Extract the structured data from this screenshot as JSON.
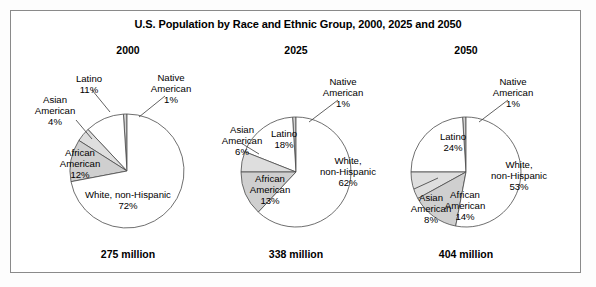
{
  "chart_data": {
    "type": "pie",
    "title": "U.S. Population by Race and Ethnic Group, 2000, 2025 and 2050",
    "legend": "none",
    "units": "percent of total population",
    "categories": [
      "Native American",
      "Latino",
      "Asian American",
      "African American",
      "White, non-Hispanic"
    ],
    "panels": [
      {
        "year": "2000",
        "total": "275 million",
        "slices": [
          {
            "label": "Native American",
            "value": 1,
            "value_text": "1%",
            "fill": "#d2d2d2"
          },
          {
            "label": "Latino",
            "value": 11,
            "value_text": "11%",
            "fill": "#ffffff"
          },
          {
            "label": "Asian American",
            "value": 4,
            "value_text": "4%",
            "fill": "#dedede"
          },
          {
            "label": "African American",
            "value": 12,
            "value_text": "12%",
            "fill": "#cfcfcf"
          },
          {
            "label": "White, non-Hispanic",
            "value": 72,
            "value_text": "72%",
            "fill": "#ffffff"
          }
        ]
      },
      {
        "year": "2025",
        "total": "338 million",
        "slices": [
          {
            "label": "Native American",
            "value": 1,
            "value_text": "1%",
            "fill": "#d2d2d2"
          },
          {
            "label": "Latino",
            "value": 18,
            "value_text": "18%",
            "fill": "#ffffff"
          },
          {
            "label": "Asian American",
            "value": 6,
            "value_text": "6%",
            "fill": "#dedede"
          },
          {
            "label": "African American",
            "value": 13,
            "value_text": "13%",
            "fill": "#cfcfcf"
          },
          {
            "label": "White, non-Hispanic",
            "value": 62,
            "value_text": "62%",
            "fill": "#ffffff"
          }
        ]
      },
      {
        "year": "2050",
        "total": "404 million",
        "slices": [
          {
            "label": "Native American",
            "value": 1,
            "value_text": "1%",
            "fill": "#d2d2d2"
          },
          {
            "label": "Latino",
            "value": 24,
            "value_text": "24%",
            "fill": "#ffffff"
          },
          {
            "label": "Asian American",
            "value": 8,
            "value_text": "8%",
            "fill": "#dedede"
          },
          {
            "label": "African American",
            "value": 14,
            "value_text": "14%",
            "fill": "#cfcfcf"
          },
          {
            "label": "White, non-Hispanic",
            "value": 53,
            "value_text": "53%",
            "fill": "#ffffff"
          }
        ]
      }
    ]
  },
  "geometry": {
    "pies": [
      {
        "cx": 127,
        "cy": 171,
        "r": 57
      },
      {
        "cx": 296,
        "cy": 172,
        "r": 55
      },
      {
        "cx": 466,
        "cy": 172,
        "r": 55
      }
    ]
  },
  "labels": {
    "p0": {
      "native": {
        "line1": "Native",
        "line2": "American",
        "line3": "1%"
      },
      "latino": {
        "line1": "Latino",
        "line2": "11%"
      },
      "asian": {
        "line1": "Asian",
        "line2": "American",
        "line3": "4%"
      },
      "african": {
        "line1": "African",
        "line2": "American",
        "line3": "12%"
      },
      "white": {
        "line1": "White, non-Hispanic",
        "line2": "72%"
      }
    },
    "p1": {
      "native": {
        "line1": "Native",
        "line2": "American",
        "line3": "1%"
      },
      "latino": {
        "line1": "Latino",
        "line2": "18%"
      },
      "asian": {
        "line1": "Asian",
        "line2": "American",
        "line3": "6%"
      },
      "african": {
        "line1": "African",
        "line2": "American",
        "line3": "13%"
      },
      "white": {
        "line1": "White,",
        "line2": "non-Hispanic",
        "line3": "62%"
      }
    },
    "p2": {
      "native": {
        "line1": "Native",
        "line2": "American",
        "line3": "1%"
      },
      "latino": {
        "line1": "Latino",
        "line2": "24%"
      },
      "asian": {
        "line1": "Asian",
        "line2": "American",
        "line3": "8%"
      },
      "african": {
        "line1": "African",
        "line2": "American",
        "line3": "14%"
      },
      "white": {
        "line1": "White,",
        "line2": "non-Hispanic",
        "line3": "53%"
      }
    }
  }
}
